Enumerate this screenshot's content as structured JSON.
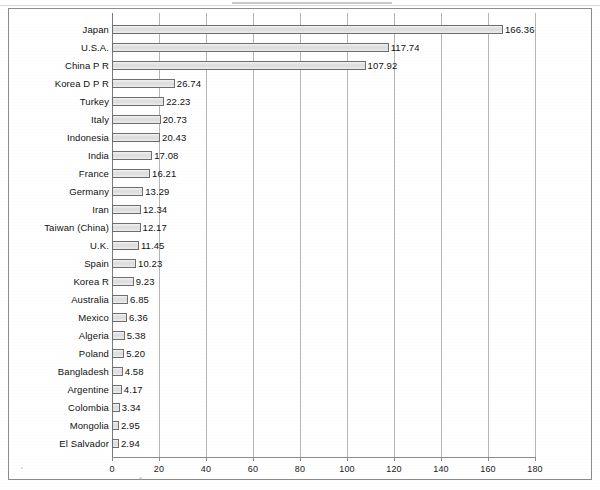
{
  "chart_data": {
    "type": "bar",
    "orientation": "horizontal",
    "title": "",
    "subtitle": "",
    "xlabel": "",
    "ylabel": "",
    "xlim": [
      0,
      180
    ],
    "xticks": [
      0,
      20,
      40,
      60,
      80,
      100,
      120,
      140,
      160,
      180
    ],
    "tick_labels": [
      "0",
      "20",
      "40",
      "60",
      "80",
      "100",
      "120",
      "140",
      "160",
      "180"
    ],
    "grid": "vertical",
    "legend": "none",
    "bar_fill_color": "#dedede",
    "bar_border_color": "#6e6e6e",
    "gridline_color": "#b5b5b5",
    "frame_color": "#8c8c8c",
    "text_color": "#111111",
    "categories": [
      "Japan",
      "U.S.A.",
      "China P R",
      "Korea D P R",
      "Turkey",
      "Italy",
      "Indonesia",
      "India",
      "France",
      "Germany",
      "Iran",
      "Taiwan (China)",
      "U.K.",
      "Spain",
      "Korea R",
      "Australia",
      "Mexico",
      "Algeria",
      "Poland",
      "Bangladesh",
      "Argentine",
      "Colombia",
      "Mongolia",
      "El Salvador"
    ],
    "values": [
      166.36,
      117.74,
      107.92,
      26.74,
      22.23,
      20.73,
      20.43,
      17.08,
      16.21,
      13.29,
      12.34,
      12.17,
      11.45,
      10.23,
      9.23,
      6.85,
      6.36,
      5.38,
      5.2,
      4.58,
      4.17,
      3.34,
      2.95,
      2.94
    ],
    "value_labels": [
      "166.36",
      "117.74",
      "107.92",
      "26.74",
      "22.23",
      "20.73",
      "20.43",
      "17.08",
      "16.21",
      "13.29",
      "12.34",
      "12.17",
      "11.45",
      "10.23",
      "9.23",
      "6.85",
      "6.36",
      "5.38",
      "5.20",
      "4.58",
      "4.17",
      "3.34",
      "2.95",
      "2.94"
    ]
  }
}
